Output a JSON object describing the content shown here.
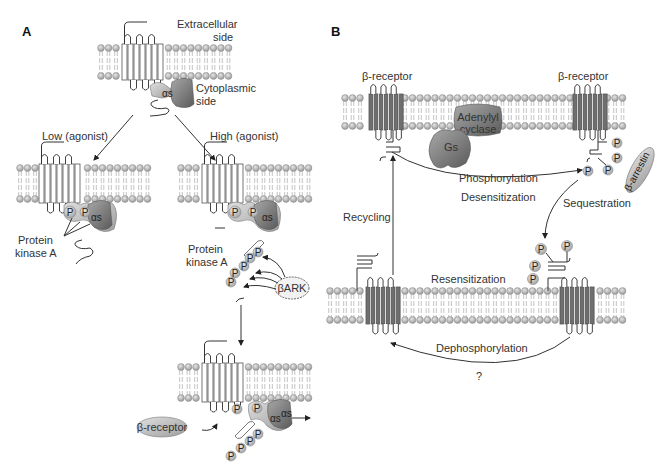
{
  "panel_a": {
    "label": "A",
    "extracellular": "Extracellular",
    "extracellular_2": "side",
    "cytoplasmic": "Cytoplasmic",
    "cytoplasmic_2": "side",
    "low_agonist": "Low (agonist)",
    "high_agonist": "High (agonist)",
    "pka_1": "Protein",
    "pka_2": "kinase A",
    "pka_high_1": "Protein",
    "pka_high_2": "kinase A",
    "bark": "βARK",
    "beta_receptor": "β-receptor",
    "alpha_s": "αs",
    "phospho": "P"
  },
  "panel_b": {
    "label": "B",
    "receptor_left": "β-receptor",
    "receptor_right": "β-receptor",
    "adenylyl_1": "Adenylyl",
    "adenylyl_2": "cyclase",
    "gs": "Gs",
    "phosphorylation": "Phosphorylation",
    "desensitization": "Desensitization",
    "sequestration": "Sequestration",
    "recycling": "Recycling",
    "resensitization": "Resensitization",
    "dephosphorylation": "Dephosphorylation",
    "question": "?",
    "arrestin": "β-arrestin",
    "phospho": "P"
  },
  "colors": {
    "lipid_head": "#b8b8b8",
    "helix_dark": "#6a6a6a",
    "protein_gray": "#8c8c8c",
    "phospho_bubble": "#c8c8c8"
  }
}
